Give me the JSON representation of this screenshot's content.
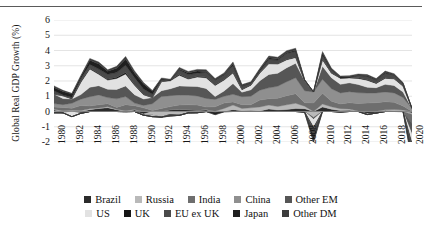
{
  "chart_data": {
    "type": "area",
    "stacked": true,
    "title": "",
    "xlabel": "",
    "ylabel": "Global Real GDP Growth (%)",
    "ylim": [
      -2,
      6
    ],
    "yticks": [
      6,
      5,
      4,
      3,
      2,
      1,
      0,
      -1,
      -2
    ],
    "ytick_labels": [
      "6",
      "5",
      "4",
      "3",
      "2",
      "1",
      "0",
      "-1",
      "-2"
    ],
    "grid": true,
    "grid_axis": "y",
    "legend_position": "bottom",
    "legend_columns": 5,
    "x": [
      1980,
      1981,
      1982,
      1983,
      1984,
      1985,
      1986,
      1987,
      1988,
      1989,
      1990,
      1991,
      1992,
      1993,
      1994,
      1995,
      1996,
      1997,
      1998,
      1999,
      2000,
      2001,
      2002,
      2003,
      2004,
      2005,
      2006,
      2007,
      2008,
      2009,
      2010,
      2011,
      2012,
      2013,
      2014,
      2015,
      2016,
      2017,
      2018,
      2019,
      2020
    ],
    "xtick_labels": [
      "1980",
      "1982",
      "1984",
      "1986",
      "1988",
      "1990",
      "1992",
      "1994",
      "1996",
      "1998",
      "2000",
      "2002",
      "2004",
      "2006",
      "2008",
      "2010",
      "2012",
      "2014",
      "2016",
      "2018",
      "2020"
    ],
    "xlim": [
      1980,
      2020
    ],
    "series": [
      {
        "name": "Brazil",
        "color": "#2b2b2b",
        "values": [
          0.1,
          -0.08,
          0.03,
          -0.12,
          0.12,
          0.2,
          0.25,
          0.12,
          -0.01,
          0.1,
          -0.16,
          0.03,
          -0.02,
          0.12,
          0.15,
          0.12,
          0.08,
          0.1,
          0.01,
          0.01,
          0.12,
          0.05,
          0.07,
          0.04,
          0.16,
          0.1,
          0.13,
          0.2,
          0.18,
          -0.05,
          0.3,
          0.15,
          0.06,
          0.09,
          0.02,
          -0.13,
          -0.1,
          0.06,
          0.05,
          0.05,
          -0.1
        ]
      },
      {
        "name": "Russia",
        "color": "#b9b9b9",
        "values": [
          0.05,
          0.05,
          0.05,
          0.06,
          0.06,
          0.03,
          0.06,
          0.03,
          0.05,
          0.03,
          -0.08,
          -0.25,
          -0.35,
          -0.2,
          -0.25,
          -0.09,
          -0.08,
          0.03,
          -0.09,
          0.19,
          0.3,
          0.15,
          0.17,
          0.26,
          0.26,
          0.23,
          0.31,
          0.34,
          0.17,
          -0.36,
          0.19,
          0.16,
          0.12,
          0.07,
          0.01,
          -0.07,
          0.01,
          0.06,
          0.08,
          0.05,
          -0.09
        ]
      },
      {
        "name": "India",
        "color": "#6e6e6e",
        "values": [
          0.15,
          0.22,
          0.13,
          0.33,
          0.18,
          0.21,
          0.2,
          0.12,
          0.4,
          0.25,
          0.24,
          0.04,
          0.2,
          0.2,
          0.27,
          0.32,
          0.34,
          0.16,
          0.3,
          0.35,
          0.21,
          0.25,
          0.2,
          0.45,
          0.42,
          0.54,
          0.6,
          0.62,
          0.23,
          0.56,
          0.7,
          0.37,
          0.32,
          0.41,
          0.5,
          0.55,
          0.57,
          0.52,
          0.47,
          0.26,
          -0.6
        ]
      },
      {
        "name": "China",
        "color": "#8f8f8f",
        "values": [
          0.22,
          0.18,
          0.33,
          0.42,
          0.61,
          0.65,
          0.4,
          0.56,
          0.53,
          0.17,
          0.16,
          0.44,
          0.78,
          0.72,
          0.66,
          0.63,
          0.6,
          0.57,
          0.48,
          0.45,
          0.5,
          0.52,
          0.56,
          0.65,
          0.71,
          0.79,
          0.91,
          1.05,
          0.78,
          0.72,
          0.92,
          0.81,
          0.72,
          0.73,
          0.7,
          0.66,
          0.64,
          0.64,
          0.62,
          0.56,
          0.2
        ]
      },
      {
        "name": "Other EM",
        "color": "#565656",
        "values": [
          0.62,
          0.4,
          0.28,
          0.3,
          0.62,
          0.6,
          0.55,
          0.62,
          0.7,
          0.55,
          0.42,
          0.4,
          0.38,
          0.45,
          0.6,
          0.58,
          0.62,
          0.65,
          0.2,
          0.34,
          0.7,
          0.3,
          0.42,
          0.62,
          0.88,
          0.85,
          0.92,
          0.95,
          0.66,
          -0.1,
          0.86,
          0.72,
          0.56,
          0.58,
          0.54,
          0.38,
          0.34,
          0.5,
          0.48,
          0.36,
          -0.7
        ]
      },
      {
        "name": "US",
        "color": "#e2e2e2",
        "values": [
          -0.06,
          0.18,
          -0.34,
          0.8,
          1.2,
          0.75,
          0.6,
          0.72,
          0.78,
          0.62,
          0.28,
          -0.06,
          0.6,
          0.52,
          0.7,
          0.48,
          0.62,
          0.7,
          0.72,
          0.72,
          0.7,
          0.16,
          0.3,
          0.5,
          0.7,
          0.6,
          0.52,
          0.38,
          -0.02,
          -0.52,
          0.42,
          0.3,
          0.4,
          0.32,
          0.4,
          0.46,
          0.28,
          0.4,
          0.44,
          0.38,
          -0.6
        ]
      },
      {
        "name": "UK",
        "color": "#161616",
        "values": [
          -0.03,
          -0.01,
          0.03,
          0.06,
          0.05,
          0.06,
          0.06,
          0.08,
          0.09,
          0.05,
          0.02,
          -0.03,
          0.0,
          0.04,
          0.06,
          0.04,
          0.05,
          0.06,
          0.05,
          0.04,
          0.05,
          0.02,
          0.03,
          0.04,
          0.04,
          0.04,
          0.04,
          0.03,
          -0.01,
          -0.08,
          0.03,
          0.02,
          0.02,
          0.03,
          0.04,
          0.03,
          0.03,
          0.03,
          0.02,
          0.02,
          -0.13
        ]
      },
      {
        "name": "EU ex UK",
        "color": "#4a4a4a",
        "values": [
          0.22,
          0.05,
          0.08,
          0.2,
          0.25,
          0.28,
          0.32,
          0.3,
          0.48,
          0.45,
          0.35,
          0.22,
          0.12,
          -0.1,
          0.28,
          0.25,
          0.2,
          0.3,
          0.32,
          0.32,
          0.42,
          0.22,
          0.12,
          0.1,
          0.25,
          0.22,
          0.38,
          0.38,
          0.06,
          -0.55,
          0.25,
          0.22,
          -0.06,
          0.0,
          0.16,
          0.22,
          0.2,
          0.3,
          0.22,
          0.16,
          -0.75
        ]
      },
      {
        "name": "Japan",
        "color": "#1f1f1f",
        "values": [
          0.22,
          0.23,
          0.21,
          0.12,
          0.27,
          0.34,
          0.2,
          0.28,
          0.42,
          0.3,
          0.33,
          0.2,
          0.06,
          0.01,
          0.05,
          0.1,
          0.14,
          0.05,
          -0.12,
          -0.02,
          0.12,
          0.02,
          0.01,
          0.09,
          0.1,
          0.07,
          0.05,
          0.06,
          -0.04,
          -0.26,
          0.16,
          0.0,
          0.07,
          0.06,
          0.01,
          0.04,
          0.02,
          0.05,
          0.02,
          -0.01,
          -0.22
        ]
      },
      {
        "name": "Other DM",
        "color": "#3c3c3c",
        "values": [
          0.1,
          0.08,
          0.05,
          0.07,
          0.12,
          0.12,
          0.1,
          0.13,
          0.16,
          0.14,
          0.1,
          0.05,
          0.06,
          0.06,
          0.12,
          0.11,
          0.11,
          0.12,
          0.08,
          0.11,
          0.13,
          0.08,
          0.07,
          0.08,
          0.12,
          0.12,
          0.13,
          0.14,
          0.02,
          -0.14,
          0.1,
          0.09,
          0.06,
          0.06,
          0.08,
          0.08,
          0.07,
          0.09,
          0.08,
          0.06,
          -0.2
        ]
      }
    ]
  },
  "legend": {
    "rows": [
      [
        {
          "label": "Brazil",
          "color": "#2b2b2b"
        },
        {
          "label": "Russia",
          "color": "#b9b9b9"
        },
        {
          "label": "India",
          "color": "#6e6e6e"
        },
        {
          "label": "China",
          "color": "#8f8f8f"
        },
        {
          "label": "Other EM",
          "color": "#565656"
        }
      ],
      [
        {
          "label": "US",
          "color": "#e2e2e2"
        },
        {
          "label": "UK",
          "color": "#161616"
        },
        {
          "label": "EU ex UK",
          "color": "#4a4a4a"
        },
        {
          "label": "Japan",
          "color": "#1f1f1f"
        },
        {
          "label": "Other DM",
          "color": "#3c3c3c"
        }
      ]
    ]
  }
}
